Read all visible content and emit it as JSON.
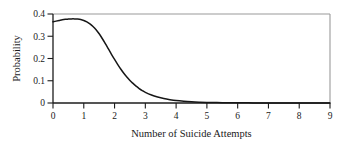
{
  "chart_data": {
    "type": "line",
    "title": "",
    "xlabel": "Number of Suicide Attempts",
    "ylabel": "Probability",
    "xlim": [
      0,
      9
    ],
    "ylim": [
      0,
      0.4
    ],
    "grid": false,
    "legend": null,
    "xticks": [
      "0",
      "1",
      "2",
      "3",
      "4",
      "5",
      "6",
      "7",
      "8",
      "9"
    ],
    "xtick_values": [
      0,
      1,
      2,
      3,
      4,
      5,
      6,
      7,
      8,
      9
    ],
    "yticks": [
      "0",
      "0.1",
      "0.2",
      "0.3",
      "0.4"
    ],
    "ytick_values": [
      0,
      0.1,
      0.2,
      0.3,
      0.4
    ],
    "series": [
      {
        "name": "Probability density",
        "color": "#161616",
        "x": [
          0,
          0.1,
          0.2,
          0.3,
          0.4,
          0.5,
          0.6,
          0.7,
          0.8,
          0.9,
          1.0,
          1.1,
          1.2,
          1.3,
          1.4,
          1.5,
          1.6,
          1.7,
          1.8,
          1.9,
          2.0,
          2.1,
          2.2,
          2.3,
          2.4,
          2.5,
          2.6,
          2.7,
          2.8,
          2.9,
          3.0,
          3.2,
          3.4,
          3.6,
          3.8,
          4.0,
          4.25,
          4.5,
          4.75,
          5.0,
          5.5,
          6.0,
          6.5,
          7.0,
          7.5,
          8.0,
          8.5,
          9.0
        ],
        "y": [
          0.365,
          0.368,
          0.371,
          0.374,
          0.376,
          0.377,
          0.378,
          0.378,
          0.377,
          0.375,
          0.371,
          0.365,
          0.356,
          0.344,
          0.329,
          0.311,
          0.29,
          0.267,
          0.243,
          0.219,
          0.196,
          0.174,
          0.153,
          0.134,
          0.117,
          0.101,
          0.088,
          0.076,
          0.065,
          0.056,
          0.048,
          0.036,
          0.027,
          0.02,
          0.015,
          0.011,
          0.0078,
          0.0055,
          0.0039,
          0.0028,
          0.0015,
          0.0008,
          0.0005,
          0.0003,
          0.0002,
          0.0001,
          0.0001,
          0.0001
        ]
      }
    ]
  },
  "axes": {
    "ylabel": "Probability",
    "xlabel": "Number of Suicide Attempts"
  },
  "colors": {
    "curve": "#161616",
    "frame_light": "#9a9a9a",
    "frame_dark": "#1c1c1c",
    "text": "#1a1a1a",
    "background": "#ffffff"
  }
}
